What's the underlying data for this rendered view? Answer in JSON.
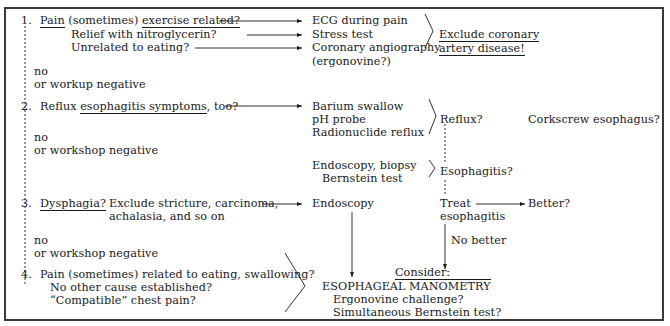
{
  "step1": {
    "number": "1.",
    "line1_prefix": "Pain",
    "line1_mid": " (sometimes) ",
    "line1_underlined": "exercise related?",
    "line2": "Relief with nitroglycerin?",
    "line3": "Unrelated to eating?",
    "tests": [
      "ECG during pain",
      "Stress test",
      "Coronary angiography",
      "(ergonovine?)"
    ],
    "conclusion_line1": "Exclude coronary",
    "conclusion_line2": "artery disease!",
    "no_label": "no",
    "negative_label": "or workup negative"
  },
  "step2": {
    "number": "2.",
    "prefix": "Reflux ",
    "underlined": "esophagitis symptoms",
    "suffix": ", too?",
    "tests": [
      "Barium swallow",
      "pH probe",
      "Radionuclide reflux"
    ],
    "result": "Reflux?",
    "side_note": "Corkscrew esophagus?",
    "tests2": [
      "Endoscopy, biopsy",
      "Bernstein test"
    ],
    "result2": "Esophagitis?",
    "no_label": "no",
    "negative_label": "or workshop negative"
  },
  "step3": {
    "number": "3.",
    "underlined": "Dysphagia?",
    "desc_line1": "Exclude stricture, carcinoma,",
    "desc_line2": "achalasia, and so on",
    "test": "Endoscopy",
    "treat_line1": "Treat",
    "treat_line2": "esophagitis",
    "better": "Better?",
    "no_better": "No better",
    "no_label": "no",
    "negative_label": "or workshop negative"
  },
  "step4": {
    "number": "4.",
    "line1": "Pain (sometimes) related to eating, swallowing?",
    "line2": "No other cause established?",
    "line3": "“Compatible” chest pain?",
    "consider": "Consider:",
    "manometry_a": "ESOPHAGEAL ",
    "manometry_b": "MANOMETRY",
    "option1": "Ergonovine challenge?",
    "option2": "Simultaneous Bernstein test?"
  }
}
